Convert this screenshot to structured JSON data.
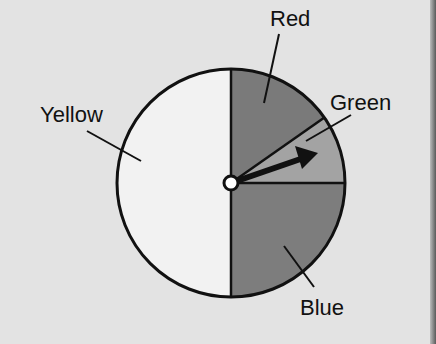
{
  "spinner": {
    "center": [
      231,
      183
    ],
    "radius": 114,
    "sections": [
      {
        "name": "Red",
        "start_deg": 90,
        "end_deg": 35,
        "fill": "#7a7a7a"
      },
      {
        "name": "Green",
        "start_deg": 35,
        "end_deg": 0,
        "fill": "#a3a3a3"
      },
      {
        "name": "Blue",
        "start_deg": 0,
        "end_deg": -90,
        "fill": "#7d7d7d"
      },
      {
        "name": "Yellow",
        "start_deg": -90,
        "end_deg": -270,
        "fill": "#f2f2f2"
      }
    ],
    "arrow_angle_deg": 19
  },
  "labels": {
    "red": "Red",
    "green": "Green",
    "blue": "Blue",
    "yellow": "Yellow"
  },
  "colors": {
    "background": "#e3e3e3",
    "outline": "#111111"
  }
}
